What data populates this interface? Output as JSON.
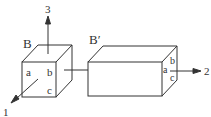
{
  "diagram": {
    "cube_B": {
      "label": "B",
      "face_labels": {
        "a": "a",
        "b": "b",
        "c": "c"
      }
    },
    "box_B_prime": {
      "label": "B′",
      "face_labels": {
        "a": "a",
        "b": "b",
        "c": "c"
      }
    },
    "axes": {
      "axis_1": "1",
      "axis_2": "2",
      "axis_3": "3"
    },
    "colors": {
      "stroke": "#333333",
      "background": "#ffffff"
    }
  }
}
